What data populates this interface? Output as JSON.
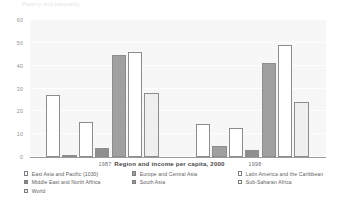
{
  "top_strip": {
    "ghost_text": "Poverty and inequality"
  },
  "chart_data": {
    "type": "bar",
    "title": "",
    "xlabel": "Region and income per capita, 2000",
    "ylabel": "",
    "ylim": [
      0,
      60
    ],
    "yticks": [
      0,
      10,
      20,
      30,
      40,
      50,
      60
    ],
    "grid": true,
    "legend_position": "bottom",
    "categories": [
      "1987",
      "1998"
    ],
    "series": [
      {
        "name": "East Asia and Pacific (1030)",
        "fill": "white",
        "values": [
          27,
          14.5
        ]
      },
      {
        "name": "Europe and Central Asia",
        "fill": "dark",
        "values": [
          0.5,
          5
        ]
      },
      {
        "name": "Latin America and the Caribbean",
        "fill": "white",
        "values": [
          15.5,
          12.5
        ]
      },
      {
        "name": "Middle East and North Africa",
        "fill": "darker",
        "values": [
          4,
          3
        ]
      },
      {
        "name": "South Asia",
        "fill": "dark",
        "values": [
          44.5,
          41
        ]
      },
      {
        "name": "Sub-Saharan Africa",
        "fill": "white",
        "values": [
          46,
          49
        ]
      },
      {
        "name": "World",
        "fill": "light",
        "values": [
          28,
          24
        ]
      }
    ]
  },
  "axis": {
    "ytick_labels": [
      "60",
      "50",
      "40",
      "30",
      "20",
      "10",
      "0"
    ],
    "group_labels": [
      "1987",
      "1998"
    ],
    "xtitle": "Region and income per capita, 2000"
  },
  "legend": {
    "columns": [
      {
        "items": [
          {
            "label": "East Asia and Pacific (1030)",
            "swatch": "white"
          },
          {
            "label": "Middle East and North Affrica",
            "swatch": "darker"
          },
          {
            "label": "World",
            "swatch": "light"
          }
        ]
      },
      {
        "items": [
          {
            "label": "Europe and Central Asia",
            "swatch": "dark"
          },
          {
            "label": "South Asia",
            "swatch": "dark"
          }
        ]
      },
      {
        "items": [
          {
            "label": "Latin America and the Caribbean",
            "swatch": "white"
          },
          {
            "label": "Sub-Saharan Africa",
            "swatch": "white"
          }
        ]
      }
    ]
  },
  "colors": {
    "plot_background": "#f7f7f7",
    "gridline": "#ffffff",
    "bar_outline": "#8d8d8d",
    "text": "#5e5e5e"
  }
}
